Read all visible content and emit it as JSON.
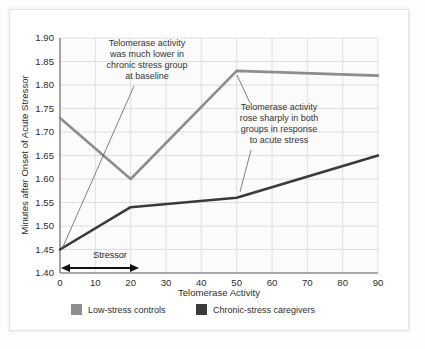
{
  "chart_data": {
    "type": "line",
    "title": "",
    "xlabel": "Telomerase Activity",
    "ylabel": "Minutes after Onset of Acute Stressor",
    "xlim": [
      0,
      90
    ],
    "ylim": [
      1.4,
      1.9
    ],
    "grid": true,
    "x_ticks": [
      "0",
      "10",
      "20",
      "30",
      "40",
      "50",
      "60",
      "70",
      "80",
      "90"
    ],
    "y_ticks": [
      "1.40",
      "1.45",
      "1.50",
      "1.55",
      "1.60",
      "1.65",
      "1.70",
      "1.75",
      "1.80",
      "1.85",
      "1.90"
    ],
    "legend_position": "bottom",
    "series": [
      {
        "name": "Low-stress controls",
        "color": "#8d8d8d",
        "x": [
          0,
          20,
          50,
          90
        ],
        "values": [
          1.73,
          1.6,
          1.83,
          1.82
        ]
      },
      {
        "name": "Chronic-stress caregivers",
        "color": "#3a3a3a",
        "x": [
          0,
          20,
          50,
          90
        ],
        "values": [
          1.45,
          1.54,
          1.56,
          1.65
        ]
      }
    ],
    "annotations": [
      {
        "id": "annotation-baseline",
        "lines": [
          "Telomerase activity",
          "was much lower in",
          "chronic stress group",
          "at baseline"
        ],
        "points_to": {
          "x": 0,
          "y": 1.45
        }
      },
      {
        "id": "annotation-acute-stress",
        "lines": [
          "Telomerase activity",
          "rose sharply in both",
          "groups in response",
          "to acute stress"
        ],
        "points_to_first": {
          "x": 50,
          "y": 1.83
        },
        "points_to_second": {
          "x": 50,
          "y": 1.56
        }
      }
    ],
    "span_marker": {
      "label": "Stressor",
      "from": 0,
      "to": 22,
      "at_y": 1.405
    }
  },
  "legend": {
    "items": [
      {
        "label": "Low-stress controls",
        "color": "#8d8d8d"
      },
      {
        "label": "Chronic-stress caregivers",
        "color": "#3a3a3a"
      }
    ]
  },
  "colors": {
    "low_stress": "#8d8d8d",
    "chronic_stress": "#3a3a3a",
    "grid": "#d8d8d8",
    "axis": "#8c8c8c",
    "plot_background": "#fbfbfb",
    "page_background": "#ffffff"
  }
}
